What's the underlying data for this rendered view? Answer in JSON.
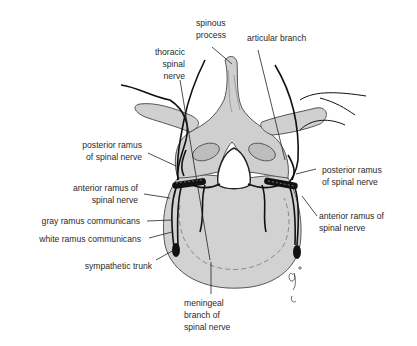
{
  "diagram": {
    "colors": {
      "bone_fill": "#d2d2d2",
      "bone_outline": "#555555",
      "nerve": "#111111",
      "label_text": "#2a2a2a",
      "leader_line": "#222222"
    },
    "labels": {
      "spinous_process": "spinous\nprocess",
      "articular_branch": "articular branch",
      "thoracic_spinal_nerve": "thoracic\nspinal\nnerve",
      "posterior_ramus_left": "posterior ramus\nof spinal nerve",
      "posterior_ramus_right": "posterior ramus\nof spinal nerve",
      "anterior_ramus_left": "anterior ramus of\nspinal nerve",
      "anterior_ramus_right": "anterior ramus of\nspinal nerve",
      "gray_ramus": "gray ramus communicans",
      "white_ramus": "white ramus communicans",
      "sympathetic_trunk": "sympathetic trunk",
      "meningeal_branch": "meningeal\nbranch of\nspinal nerve"
    },
    "signature": "artist initials"
  }
}
